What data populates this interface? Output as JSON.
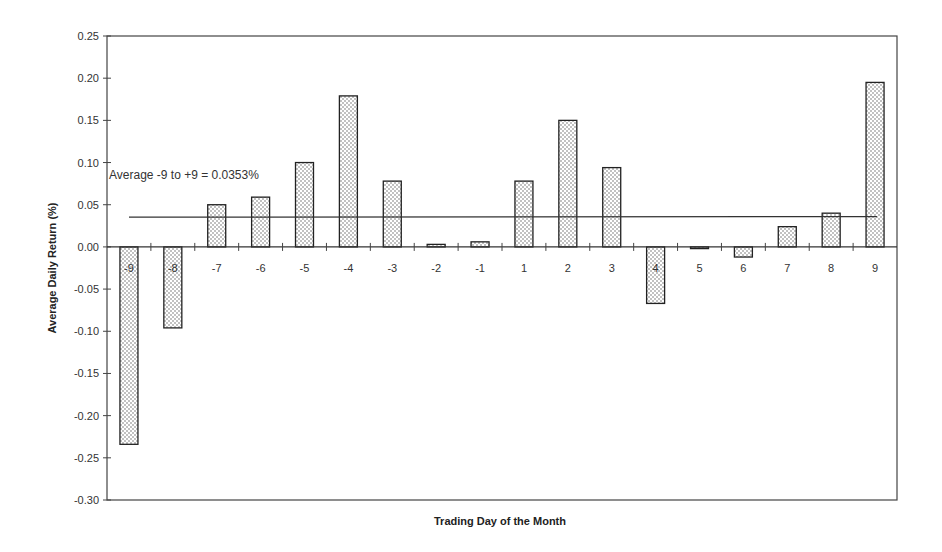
{
  "chart_data": {
    "type": "bar",
    "title": "",
    "xlabel": "Trading Day of the Month",
    "ylabel": "Average Daily Return (%)",
    "ylim": [
      -0.3,
      0.25
    ],
    "yticks": [
      "0.25",
      "0.20",
      "0.15",
      "0.10",
      "0.05",
      "0.00",
      "-0.05",
      "-0.10",
      "-0.15",
      "-0.20",
      "-0.25",
      "-0.30"
    ],
    "grid": false,
    "legend": null,
    "categories": [
      "-9",
      "-8",
      "-7",
      "-6",
      "-5",
      "-4",
      "-3",
      "-2",
      "-1",
      "1",
      "2",
      "3",
      "4",
      "5",
      "6",
      "7",
      "8",
      "9"
    ],
    "values": [
      -0.234,
      -0.096,
      0.05,
      0.059,
      0.1,
      0.179,
      0.078,
      0.003,
      0.006,
      0.078,
      0.15,
      0.094,
      -0.067,
      -0.002,
      -0.012,
      0.024,
      0.04,
      0.195
    ],
    "reference_line": {
      "value": 0.0353,
      "label": "Average -9 to +9 = 0.0353%"
    },
    "bar_fill": "dotted"
  }
}
